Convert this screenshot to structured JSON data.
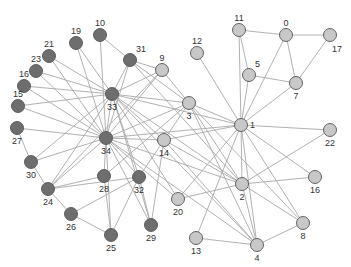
{
  "chart_data": {
    "type": "network",
    "title": "",
    "groups": {
      "light": {
        "color": "#c8c8c8"
      },
      "dark": {
        "color": "#6e6e6e"
      }
    },
    "nodes": [
      {
        "id": "0",
        "group": "light"
      },
      {
        "id": "1",
        "group": "light"
      },
      {
        "id": "2",
        "group": "light"
      },
      {
        "id": "3",
        "group": "light"
      },
      {
        "id": "4",
        "group": "light"
      },
      {
        "id": "5",
        "group": "light"
      },
      {
        "id": "7",
        "group": "light"
      },
      {
        "id": "8",
        "group": "light"
      },
      {
        "id": "9",
        "group": "light"
      },
      {
        "id": "11",
        "group": "light"
      },
      {
        "id": "12",
        "group": "light"
      },
      {
        "id": "13",
        "group": "light"
      },
      {
        "id": "14",
        "group": "light"
      },
      {
        "id": "16",
        "group": "light"
      },
      {
        "id": "17",
        "group": "light"
      },
      {
        "id": "20",
        "group": "light"
      },
      {
        "id": "22",
        "group": "light"
      },
      {
        "id": "10",
        "group": "dark"
      },
      {
        "id": "15",
        "group": "dark"
      },
      {
        "id": "19",
        "group": "dark"
      },
      {
        "id": "21",
        "group": "dark"
      },
      {
        "id": "23",
        "group": "dark"
      },
      {
        "id": "16b",
        "group": "dark",
        "label": "16"
      },
      {
        "id": "24",
        "group": "dark"
      },
      {
        "id": "25",
        "group": "dark"
      },
      {
        "id": "26",
        "group": "dark"
      },
      {
        "id": "27",
        "group": "dark"
      },
      {
        "id": "28",
        "group": "dark"
      },
      {
        "id": "29",
        "group": "dark"
      },
      {
        "id": "30",
        "group": "dark"
      },
      {
        "id": "31",
        "group": "dark"
      },
      {
        "id": "32",
        "group": "dark"
      },
      {
        "id": "33",
        "group": "dark"
      },
      {
        "id": "34",
        "group": "dark"
      }
    ],
    "edges": [
      [
        "0",
        "11"
      ],
      [
        "0",
        "17"
      ],
      [
        "0",
        "7"
      ],
      [
        "0",
        "1"
      ],
      [
        "11",
        "5"
      ],
      [
        "11",
        "1"
      ],
      [
        "5",
        "7"
      ],
      [
        "5",
        "1"
      ],
      [
        "7",
        "17"
      ],
      [
        "7",
        "1"
      ],
      [
        "12",
        "1"
      ],
      [
        "1",
        "22"
      ],
      [
        "1",
        "16"
      ],
      [
        "1",
        "2"
      ],
      [
        "1",
        "4"
      ],
      [
        "1",
        "8"
      ],
      [
        "1",
        "3"
      ],
      [
        "1",
        "14"
      ],
      [
        "1",
        "20"
      ],
      [
        "1",
        "13"
      ],
      [
        "1",
        "34"
      ],
      [
        "1",
        "33"
      ],
      [
        "3",
        "9"
      ],
      [
        "3",
        "2"
      ],
      [
        "3",
        "4"
      ],
      [
        "3",
        "8"
      ],
      [
        "3",
        "32"
      ],
      [
        "3",
        "34"
      ],
      [
        "3",
        "33"
      ],
      [
        "3",
        "31"
      ],
      [
        "2",
        "16"
      ],
      [
        "2",
        "20"
      ],
      [
        "2",
        "22"
      ],
      [
        "2",
        "4"
      ],
      [
        "2",
        "8"
      ],
      [
        "2",
        "14"
      ],
      [
        "2",
        "34"
      ],
      [
        "2",
        "33"
      ],
      [
        "4",
        "13"
      ],
      [
        "4",
        "8"
      ],
      [
        "4",
        "14"
      ],
      [
        "4",
        "33"
      ],
      [
        "4",
        "34"
      ],
      [
        "9",
        "31"
      ],
      [
        "9",
        "33"
      ],
      [
        "9",
        "34"
      ],
      [
        "9",
        "24"
      ],
      [
        "14",
        "34"
      ],
      [
        "14",
        "29"
      ],
      [
        "10",
        "31"
      ],
      [
        "10",
        "34"
      ],
      [
        "31",
        "33"
      ],
      [
        "31",
        "34"
      ],
      [
        "31",
        "2"
      ],
      [
        "19",
        "33"
      ],
      [
        "19",
        "34"
      ],
      [
        "21",
        "33"
      ],
      [
        "21",
        "34"
      ],
      [
        "23",
        "33"
      ],
      [
        "23",
        "34"
      ],
      [
        "16b",
        "33"
      ],
      [
        "16b",
        "34"
      ],
      [
        "15",
        "33"
      ],
      [
        "15",
        "34"
      ],
      [
        "27",
        "34"
      ],
      [
        "27",
        "30"
      ],
      [
        "30",
        "34"
      ],
      [
        "30",
        "33"
      ],
      [
        "30",
        "24"
      ],
      [
        "24",
        "34"
      ],
      [
        "24",
        "28"
      ],
      [
        "24",
        "26"
      ],
      [
        "24",
        "33"
      ],
      [
        "24",
        "32"
      ],
      [
        "28",
        "34"
      ],
      [
        "28",
        "25"
      ],
      [
        "28",
        "3"
      ],
      [
        "26",
        "25"
      ],
      [
        "26",
        "32"
      ],
      [
        "32",
        "34"
      ],
      [
        "32",
        "33"
      ],
      [
        "32",
        "29"
      ],
      [
        "29",
        "34"
      ],
      [
        "29",
        "33"
      ],
      [
        "25",
        "34"
      ],
      [
        "25",
        "32"
      ],
      [
        "20",
        "34"
      ],
      [
        "20",
        "33"
      ],
      [
        "33",
        "34"
      ],
      [
        "33",
        "14"
      ]
    ]
  }
}
